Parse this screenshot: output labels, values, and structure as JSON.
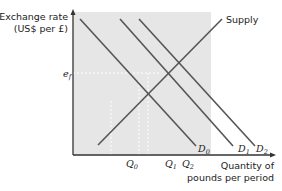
{
  "diagram": {
    "y_axis_label_line1": "Exchange rate",
    "y_axis_label_line2": "(US$ per £)",
    "x_axis_label_line1": "Quantity of",
    "x_axis_label_line2": "pounds per period",
    "equilibrium_price_label": "e",
    "equilibrium_price_sub": "f",
    "supply_label": "Supply",
    "demand_curves": [
      {
        "name": "D",
        "sub": "0"
      },
      {
        "name": "D",
        "sub": "1"
      },
      {
        "name": "D",
        "sub": "2"
      }
    ],
    "quantity_ticks": [
      {
        "name": "Q",
        "sub": "0"
      },
      {
        "name": "Q",
        "sub": "1"
      },
      {
        "name": "Q",
        "sub": "2"
      }
    ],
    "colors": {
      "plot_background": "#e6e6e6",
      "line": "#555555",
      "axis": "#333333",
      "dashed": "#ffffff"
    }
  }
}
